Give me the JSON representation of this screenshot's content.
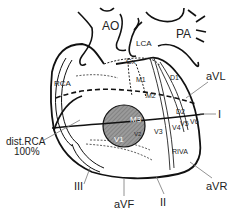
{
  "diagram": {
    "labels": {
      "ao": "AO",
      "pa": "PA",
      "lca": "LCA",
      "cx": "Cx",
      "rca": "RCA",
      "m1": "M1",
      "m2": "M2",
      "m3": "M3",
      "d1": "D1",
      "d2": "D2",
      "riva": "RIVA",
      "v1": "V1",
      "v2": "V2",
      "v3": "V3",
      "v4": "V4",
      "v5": "V5",
      "v6": "V6",
      "occlusion_site": "dist.RCA",
      "occlusion_percent": "100%"
    },
    "leads": {
      "avl": "aVL",
      "i": "I",
      "avr": "aVR",
      "ii": "II",
      "avf": "aVF",
      "iii": "III"
    },
    "colors": {
      "line": "#111111",
      "infarct_fill": "#8a8a8a",
      "lead_line": "#777777"
    }
  }
}
